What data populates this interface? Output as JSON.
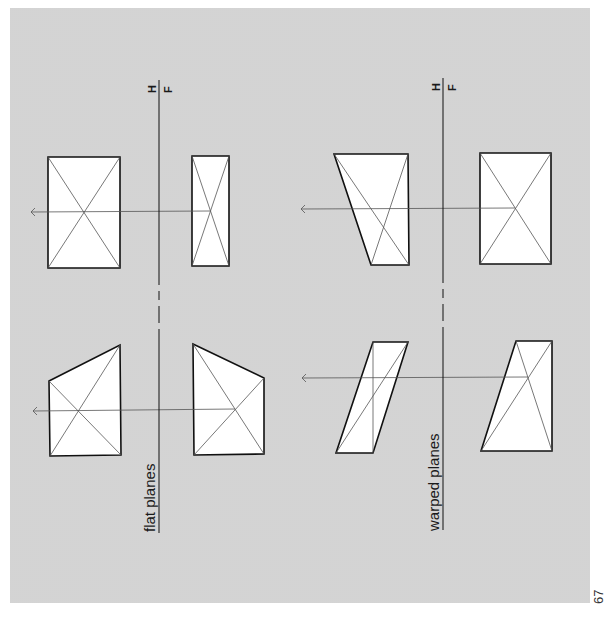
{
  "page": {
    "page_number": "67",
    "background_color": "#e6e6e6",
    "line_color": "#111111"
  },
  "diagrams": [
    {
      "title": "flat planes",
      "reference_line": {
        "upper_label": "H",
        "lower_label": "F"
      },
      "figures": [
        {
          "name": "rectangle-view-1",
          "shape": "rectangle with diagonals"
        },
        {
          "name": "narrow-rectangle-view-2",
          "shape": "narrow rectangle with diagonals"
        },
        {
          "name": "trapezoid-view-1",
          "shape": "quadrilateral with diagonals"
        },
        {
          "name": "trapezoid-view-2",
          "shape": "quadrilateral with diagonals"
        }
      ]
    },
    {
      "title": "warped planes",
      "reference_line": {
        "upper_label": "H",
        "lower_label": "F"
      },
      "figures": [
        {
          "name": "trapezoid-warped-view-1",
          "shape": "quadrilateral with diagonals"
        },
        {
          "name": "rectangle-warped-view-2",
          "shape": "rectangle with diagonals"
        },
        {
          "name": "parallelogram-warped-view-1",
          "shape": "parallelogram with diagonal"
        },
        {
          "name": "trapezoid-warped-view-2",
          "shape": "quadrilateral with diagonals"
        }
      ]
    }
  ]
}
